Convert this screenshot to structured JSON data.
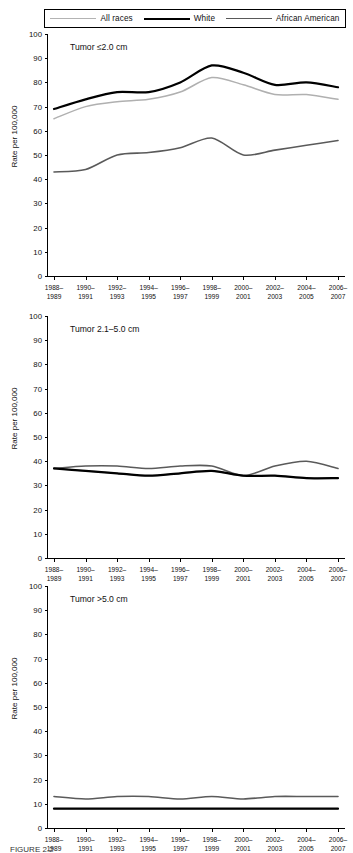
{
  "legend": {
    "entries": [
      {
        "label": "All races",
        "key": "all_races",
        "color": "#b0b0b0",
        "style": "thin-gray"
      },
      {
        "label": "White",
        "key": "white",
        "color": "#000000",
        "style": "thick-black"
      },
      {
        "label": "African American",
        "key": "african_american",
        "color": "#5a5a5a",
        "style": "medium-gray"
      }
    ]
  },
  "caption": {
    "prefix": "FIGURE 2.2",
    "text": "FIGURE 2.2"
  },
  "axis": {
    "ylabel": "Rate per 100,000",
    "yticks": [
      0,
      10,
      20,
      30,
      40,
      50,
      60,
      70,
      80,
      90,
      100
    ],
    "ylim": [
      0,
      100
    ],
    "xticklabels": [
      "1988–\n1989",
      "1990–\n1991",
      "1992–\n1993",
      "1994–\n1995",
      "1996–\n1997",
      "1998–\n1999",
      "2000–\n2001",
      "2002–\n2003",
      "2004–\n2005",
      "2006–\n2007"
    ]
  },
  "chart_data": [
    {
      "type": "line",
      "title": "Tumor ≤2.0 cm",
      "xlabel": "",
      "ylabel": "Rate per 100,000",
      "ylim": [
        0,
        100
      ],
      "grid": false,
      "legend_position": "top",
      "categories": [
        "1988–1989",
        "1990–1991",
        "1992–1993",
        "1994–1995",
        "1996–1997",
        "1998–1999",
        "2000–2001",
        "2002–2003",
        "2004–2005",
        "2006–2007"
      ],
      "series": [
        {
          "name": "All races",
          "values": [
            65,
            70,
            72,
            73,
            76,
            82,
            79,
            75,
            75,
            73
          ]
        },
        {
          "name": "White",
          "values": [
            69,
            73,
            76,
            76,
            80,
            87,
            84,
            79,
            80,
            78
          ]
        },
        {
          "name": "African American",
          "values": [
            43,
            44,
            50,
            51,
            53,
            57,
            50,
            52,
            54,
            56
          ]
        }
      ]
    },
    {
      "type": "line",
      "title": "Tumor 2.1–5.0 cm",
      "xlabel": "",
      "ylabel": "Rate per 100,000",
      "ylim": [
        0,
        100
      ],
      "grid": false,
      "legend_position": "top",
      "categories": [
        "1988–1989",
        "1990–1991",
        "1992–1993",
        "1994–1995",
        "1996–1997",
        "1998–1999",
        "2000–2001",
        "2002–2003",
        "2004–2005",
        "2006–2007"
      ],
      "series": [
        {
          "name": "All races",
          "values": [
            37,
            36,
            35,
            34,
            35,
            36,
            34,
            34,
            33,
            33
          ]
        },
        {
          "name": "White",
          "values": [
            37,
            36,
            35,
            34,
            35,
            36,
            34,
            34,
            33,
            33
          ]
        },
        {
          "name": "African American",
          "values": [
            37,
            38,
            38,
            37,
            38,
            38,
            34,
            38,
            40,
            37
          ]
        }
      ]
    },
    {
      "type": "line",
      "title": "Tumor >5.0 cm",
      "xlabel": "",
      "ylabel": "Rate per 100,000",
      "ylim": [
        0,
        100
      ],
      "grid": false,
      "legend_position": "top",
      "categories": [
        "1988–1989",
        "1990–1991",
        "1992–1993",
        "1994–1995",
        "1996–1997",
        "1998–1999",
        "2000–2001",
        "2002–2003",
        "2004–2005",
        "2006–2007"
      ],
      "series": [
        {
          "name": "All races",
          "values": [
            8,
            8,
            8,
            8,
            8,
            8,
            8,
            8,
            8,
            8
          ]
        },
        {
          "name": "White",
          "values": [
            8,
            8,
            8,
            8,
            8,
            8,
            8,
            8,
            8,
            8
          ]
        },
        {
          "name": "African American",
          "values": [
            13,
            12,
            13,
            13,
            12,
            13,
            12,
            13,
            13,
            13
          ]
        }
      ]
    }
  ]
}
